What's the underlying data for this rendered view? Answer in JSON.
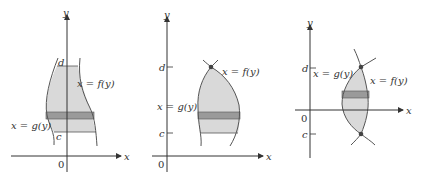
{
  "figure": {
    "panels": [
      {
        "id": "panel-1",
        "labels": {
          "y_axis": "y",
          "x_axis": "x",
          "origin": "0",
          "d": "d",
          "c": "c",
          "f": "x = f(y)",
          "g": "x = g(y)"
        }
      },
      {
        "id": "panel-2",
        "labels": {
          "y_axis": "y",
          "x_axis": "x",
          "origin": "0",
          "d": "d",
          "c": "c",
          "f": "x = f(y)",
          "g": "x = g(y)"
        }
      },
      {
        "id": "panel-3",
        "labels": {
          "y_axis": "y",
          "x_axis": "x",
          "origin": "0",
          "d": "d",
          "c": "c",
          "f": "x = f(y)",
          "g": "x = g(y)"
        }
      }
    ],
    "colors": {
      "region_fill": "#d9d9d9",
      "strip_fill": "#9a9a9a",
      "curve": "#555555",
      "axis": "#333333",
      "point": "#444444"
    }
  }
}
